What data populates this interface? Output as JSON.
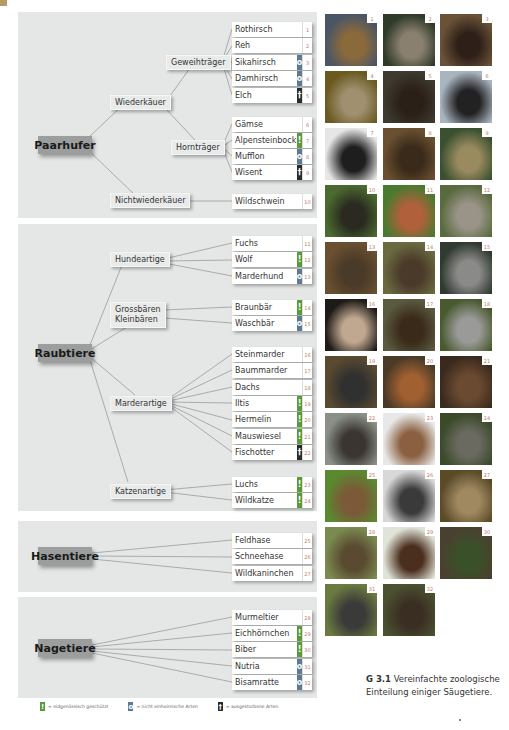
{
  "colors": {
    "panel_bg": "#e4e7e6",
    "order_box": "#9c9e9e",
    "protected": "#5a9a3a",
    "non_native": "#5e7a93",
    "extinct": "#2a2a2a",
    "number": "#c27a6a",
    "corner_tab": "#b59a63"
  },
  "icons": {
    "protected": "!",
    "non_native": "o",
    "extinct": "†"
  },
  "orders": [
    {
      "label": "Paarhufer",
      "groups": [
        {
          "label": "Wiederkäuer"
        },
        {
          "label": "Geweihträger"
        },
        {
          "label": "Hornträger"
        },
        {
          "label": "Nichtwiederkäuer"
        }
      ]
    },
    {
      "label": "Raubtiere",
      "groups": [
        {
          "label": "Hundeartige"
        },
        {
          "label": "Grossbären"
        },
        {
          "label": "Kleinbären"
        },
        {
          "label": "Marderartige"
        },
        {
          "label": "Katzenartige"
        }
      ]
    },
    {
      "label": "Hasentiere",
      "groups": []
    },
    {
      "label": "Nagetiere",
      "groups": []
    }
  ],
  "species": [
    {
      "name": "Rothirsch",
      "num": "1",
      "status": ""
    },
    {
      "name": "Reh",
      "num": "2",
      "status": ""
    },
    {
      "name": "Sikahirsch",
      "num": "3",
      "status": "non_native"
    },
    {
      "name": "Damhirsch",
      "num": "4",
      "status": "non_native"
    },
    {
      "name": "Elch",
      "num": "5",
      "status": "extinct"
    },
    {
      "name": "Gämse",
      "num": "6",
      "status": ""
    },
    {
      "name": "Alpensteinbock",
      "num": "7",
      "status": "protected"
    },
    {
      "name": "Mufflon",
      "num": "8",
      "status": "non_native"
    },
    {
      "name": "Wisent",
      "num": "9",
      "status": "extinct"
    },
    {
      "name": "Wildschwein",
      "num": "10",
      "status": ""
    },
    {
      "name": "Fuchs",
      "num": "11",
      "status": ""
    },
    {
      "name": "Wolf",
      "num": "12",
      "status": "protected"
    },
    {
      "name": "Marderhund",
      "num": "13",
      "status": "non_native"
    },
    {
      "name": "Braunbär",
      "num": "14",
      "status": "protected"
    },
    {
      "name": "Waschbär",
      "num": "15",
      "status": "non_native"
    },
    {
      "name": "Steinmarder",
      "num": "16",
      "status": ""
    },
    {
      "name": "Baummarder",
      "num": "17",
      "status": ""
    },
    {
      "name": "Dachs",
      "num": "18",
      "status": ""
    },
    {
      "name": "Iltis",
      "num": "19",
      "status": "protected"
    },
    {
      "name": "Hermelin",
      "num": "20",
      "status": "protected"
    },
    {
      "name": "Mauswiesel",
      "num": "21",
      "status": "protected"
    },
    {
      "name": "Fischotter",
      "num": "22",
      "status": "extinct"
    },
    {
      "name": "Luchs",
      "num": "23",
      "status": "protected"
    },
    {
      "name": "Wildkatze",
      "num": "24",
      "status": "protected"
    },
    {
      "name": "Feldhase",
      "num": "25",
      "status": ""
    },
    {
      "name": "Schneehase",
      "num": "26",
      "status": ""
    },
    {
      "name": "Wildkaninchen",
      "num": "27",
      "status": ""
    },
    {
      "name": "Murmeltier",
      "num": "28",
      "status": ""
    },
    {
      "name": "Eichhörnchen",
      "num": "29",
      "status": "protected"
    },
    {
      "name": "Biber",
      "num": "30",
      "status": "protected"
    },
    {
      "name": "Nutria",
      "num": "31",
      "status": "non_native"
    },
    {
      "name": "Bisamratte",
      "num": "32",
      "status": "non_native"
    }
  ],
  "photos": [
    {
      "num": "1",
      "subject": "Rothirsch",
      "colors": [
        "#4a5566",
        "#8a6a3a"
      ]
    },
    {
      "num": "2",
      "subject": "Reh",
      "colors": [
        "#2f3a28",
        "#8a8070"
      ]
    },
    {
      "num": "3",
      "subject": "Sikahirsch",
      "colors": [
        "#6a5238",
        "#2e2018"
      ]
    },
    {
      "num": "4",
      "subject": "Damhirsch",
      "colors": [
        "#6a5a20",
        "#a09070"
      ]
    },
    {
      "num": "5",
      "subject": "Elch",
      "colors": [
        "#3e3a30",
        "#2a2018"
      ]
    },
    {
      "num": "6",
      "subject": "Gämse",
      "colors": [
        "#a8b4c0",
        "#222222"
      ]
    },
    {
      "num": "7",
      "subject": "Alpensteinbock",
      "colors": [
        "#e6e6e6",
        "#1e1e1e"
      ]
    },
    {
      "num": "8",
      "subject": "Mufflon",
      "colors": [
        "#6a5030",
        "#3a2a1a"
      ]
    },
    {
      "num": "9",
      "subject": "Wisent",
      "colors": [
        "#3a5030",
        "#9a8a60"
      ]
    },
    {
      "num": "10",
      "subject": "Wildschwein",
      "colors": [
        "#4a6a30",
        "#2a2a20"
      ]
    },
    {
      "num": "11",
      "subject": "Fuchs",
      "colors": [
        "#4a7a30",
        "#b0603a"
      ]
    },
    {
      "num": "12",
      "subject": "Wolf",
      "colors": [
        "#5a6a40",
        "#9a9488"
      ]
    },
    {
      "num": "13",
      "subject": "Marderhund",
      "colors": [
        "#6a5030",
        "#4a3a28"
      ]
    },
    {
      "num": "14",
      "subject": "Braunbär",
      "colors": [
        "#6a6a40",
        "#4a3a2a"
      ]
    },
    {
      "num": "15",
      "subject": "Waschbär",
      "colors": [
        "#303a30",
        "#8a8a88"
      ]
    },
    {
      "num": "16",
      "subject": "Steinmarder",
      "colors": [
        "#1e1a18",
        "#c0a890"
      ]
    },
    {
      "num": "17",
      "subject": "Baummarder",
      "colors": [
        "#5a5a40",
        "#3a2a1a"
      ]
    },
    {
      "num": "18",
      "subject": "Dachs",
      "colors": [
        "#4a5a30",
        "#9a9a98"
      ]
    },
    {
      "num": "19",
      "subject": "Iltis",
      "colors": [
        "#5a4a30",
        "#303030"
      ]
    },
    {
      "num": "20",
      "subject": "Hermelin",
      "colors": [
        "#4a3a28",
        "#a06030"
      ]
    },
    {
      "num": "21",
      "subject": "Mauswiesel",
      "colors": [
        "#3a2a1e",
        "#6a4a30"
      ]
    },
    {
      "num": "22",
      "subject": "Fischotter",
      "colors": [
        "#8a9088",
        "#3a3530"
      ]
    },
    {
      "num": "23",
      "subject": "Luchs",
      "colors": [
        "#e8e8e8",
        "#8a6040"
      ]
    },
    {
      "num": "24",
      "subject": "Wildkatze",
      "colors": [
        "#3a4a2a",
        "#6a6a60"
      ]
    },
    {
      "num": "25",
      "subject": "Feldhase",
      "colors": [
        "#5a8a30",
        "#7a5a38"
      ]
    },
    {
      "num": "26",
      "subject": "Schneehase",
      "colors": [
        "#d8d8d8",
        "#3a3a3a"
      ]
    },
    {
      "num": "27",
      "subject": "Wildkaninchen",
      "colors": [
        "#5a4a28",
        "#a08860"
      ]
    },
    {
      "num": "28",
      "subject": "Murmeltier",
      "colors": [
        "#7a8a50",
        "#5a4a30"
      ]
    },
    {
      "num": "29",
      "subject": "Eichhörnchen",
      "colors": [
        "#e0e4d8",
        "#4a2e1e"
      ]
    },
    {
      "num": "30",
      "subject": "Biber",
      "colors": [
        "#4a4030",
        "#3a5028"
      ]
    },
    {
      "num": "31",
      "subject": "Nutria",
      "colors": [
        "#6a7a40",
        "#3a3a38"
      ]
    },
    {
      "num": "32",
      "subject": "Bisamratte",
      "colors": [
        "#4a5030",
        "#3a2e22"
      ]
    }
  ],
  "legend": [
    {
      "key": "protected",
      "symbol": "!",
      "label": "= eidgenössisch geschützt"
    },
    {
      "key": "non_native",
      "symbol": "o",
      "label": "= nicht einheimische Arten"
    },
    {
      "key": "extinct",
      "symbol": "†",
      "label": "= ausgestorbene Arten"
    }
  ],
  "caption": {
    "figure": "G 3.1",
    "line1": "Vereinfachte zoologische",
    "line2": "Einteilung einiger Säugetiere."
  }
}
